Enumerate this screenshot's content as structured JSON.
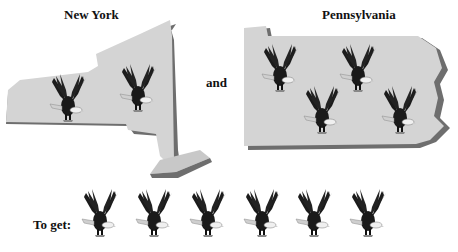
{
  "labels": {
    "ny": "New York",
    "pa": "Pennsylvania",
    "and": "and",
    "result": "To get:"
  },
  "counts": {
    "ny_eagles": 2,
    "pa_eagles": 4,
    "total_eagles": 6
  },
  "colors": {
    "map_fill": "#d4d4d4",
    "map_edge": "#6e6e6e",
    "eagle": "#1a1a1a",
    "eagle_head": "#f0f0f0"
  }
}
